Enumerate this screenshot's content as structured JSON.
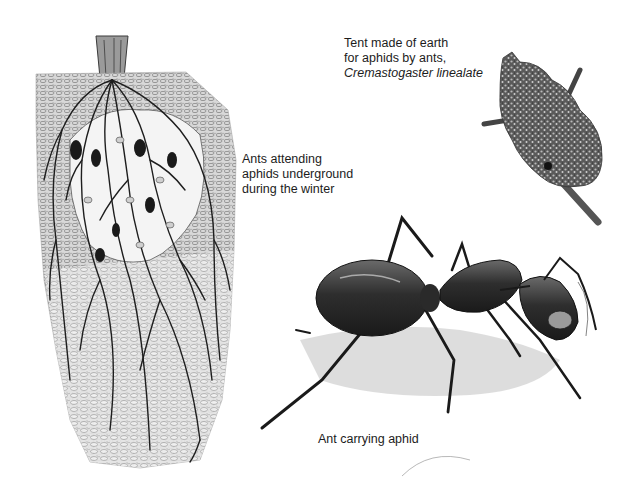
{
  "captions": {
    "tent": {
      "line1": "Tent made of earth",
      "line2": "for aphids by ants,",
      "species": "Cremastogaster linealate"
    },
    "winter": {
      "line1": "Ants attending",
      "line2": "aphids underground",
      "line3": "during the winter"
    },
    "carrying": {
      "line1": "Ant carrying aphid"
    }
  },
  "illustrations": [
    {
      "name": "underground-root-cluster",
      "subject": "soil cross-section with roots and ants tending aphids"
    },
    {
      "name": "earth-tent-on-twig",
      "subject": "earthen tent on a twig"
    },
    {
      "name": "ant-carrying-aphid",
      "subject": "large ant in profile carrying an aphid"
    }
  ],
  "colors": {
    "background": "#ffffff",
    "ink": "#1a1a1a",
    "soil_shade": "#8a8a8a",
    "light_shade": "#c8c8c8"
  }
}
